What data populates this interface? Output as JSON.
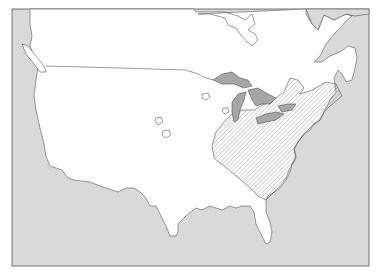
{
  "map": {
    "type": "species-range-map",
    "region": "North America (contiguous United States and southern Canada)",
    "colors": {
      "background": "#ffffff",
      "water": "#d9d9d9",
      "land": "#ffffff",
      "lakes": "#a6a6a6",
      "outline": "#555555",
      "range_hatch": "#777777"
    },
    "features": [
      {
        "name": "ocean",
        "style": "light gray fill"
      },
      {
        "name": "land",
        "style": "white fill"
      },
      {
        "name": "great-lakes",
        "style": "dark gray fill"
      },
      {
        "name": "us-canada-border",
        "style": "thin line"
      },
      {
        "name": "range-area",
        "style": "diagonal hatching",
        "location": "eastern United States"
      },
      {
        "name": "outlier-populations",
        "count": 4,
        "style": "small outlined blobs",
        "location": "central plains"
      }
    ]
  }
}
